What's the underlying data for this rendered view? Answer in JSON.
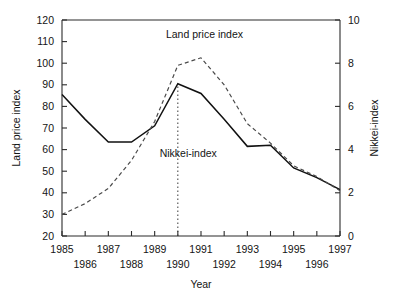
{
  "chart_data": {
    "type": "line",
    "title": "",
    "xlabel": "Year",
    "grid": false,
    "legend_position": "inline-annotations",
    "x": [
      1985,
      1986,
      1987,
      1988,
      1989,
      1990,
      1991,
      1992,
      1993,
      1994,
      1995,
      1996,
      1997
    ],
    "x_tick_labels_top": [
      "1985",
      "1987",
      "1989",
      "1991",
      "1993",
      "1995",
      "1997"
    ],
    "x_tick_labels_bottom": [
      "1986",
      "1988",
      "1990",
      "1992",
      "1994",
      "1996"
    ],
    "axes": {
      "left": {
        "label": "Land price index",
        "min": 20,
        "max": 120,
        "step": 10,
        "ticks": [
          "20",
          "30",
          "40",
          "50",
          "60",
          "70",
          "80",
          "90",
          "100",
          "110",
          "120"
        ]
      },
      "right": {
        "label": "Nikkei-index",
        "min": 0,
        "max": 10,
        "step": 2,
        "ticks": [
          "0",
          "2",
          "4",
          "6",
          "8",
          "10"
        ]
      }
    },
    "series": [
      {
        "name": "Nikkei-index",
        "axis": "right",
        "style": "solid",
        "color": "#111111",
        "values_left_scale": [
          85.5,
          74.0,
          63.5,
          63.5,
          71.0,
          90.5,
          86.0,
          74.0,
          61.5,
          62.0,
          51.5,
          47.0,
          41.5
        ],
        "values": [
          6.55,
          5.4,
          4.35,
          4.35,
          5.1,
          7.05,
          6.6,
          5.4,
          4.15,
          4.2,
          3.15,
          2.7,
          2.15
        ]
      },
      {
        "name": "Land price index",
        "axis": "left",
        "style": "dashed",
        "color": "#4a4a4a",
        "values": [
          30.0,
          35.0,
          42.0,
          55.0,
          73.0,
          99.0,
          102.5,
          90.0,
          72.0,
          63.0,
          52.5,
          47.5,
          41.0
        ]
      }
    ],
    "annotations": [
      {
        "text": "Land price index",
        "x_value": 1991.15,
        "y_left": 111.5
      },
      {
        "text": "Nikkei-index",
        "x_value": 1990.45,
        "y_left": 56.5
      }
    ],
    "marker_line": {
      "name": "nikkei-peak-marker",
      "x_value": 1990,
      "y_from_left": 20,
      "y_to_left": 90.5
    }
  }
}
